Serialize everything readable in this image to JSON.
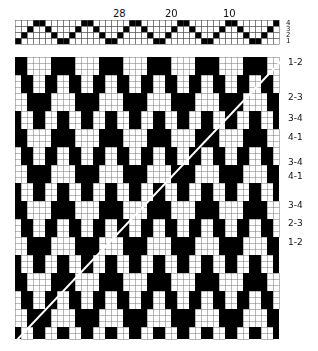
{
  "threading": {
    "numbers": [
      {
        "text": "28",
        "x": 113
      },
      {
        "text": "20",
        "x": 165
      },
      {
        "text": "10",
        "x": 223
      }
    ],
    "shafts": [
      "4",
      "3",
      "2",
      "1"
    ]
  },
  "treadling_labels": [
    {
      "text": "1-2",
      "y": 57
    },
    {
      "text": "2-3",
      "y": 92
    },
    {
      "text": "3-4",
      "y": 113
    },
    {
      "text": "4-1",
      "y": 132
    },
    {
      "text": "3-4",
      "y": 157
    },
    {
      "text": "4-1",
      "y": 171
    },
    {
      "text": "3-4",
      "y": 200
    },
    {
      "text": "2-3",
      "y": 218
    },
    {
      "text": "1-2",
      "y": 237
    }
  ],
  "grid": {
    "cols": 44,
    "rows": 47,
    "cell": 6
  }
}
